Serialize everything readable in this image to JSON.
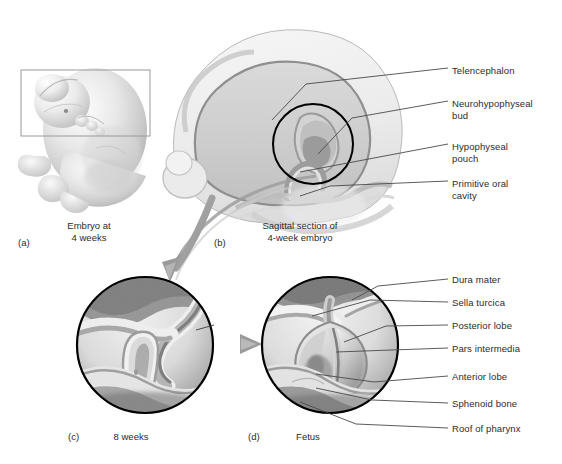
{
  "figure": {
    "background_color": "#ffffff",
    "ink_color": "#2b2b2b",
    "outline_color": "#000000",
    "arrow_color": "#9a9a9a",
    "tissue_light": "#ededed",
    "tissue_mid": "#cfcfcf",
    "tissue_dark": "#9d9d9d"
  },
  "panels": [
    {
      "id": "a",
      "letter": "(a)",
      "caption_line1": "Embryo at",
      "caption_line2": "4 weeks",
      "art": "embryo-whole-body-4-weeks",
      "has_selection_box": true
    },
    {
      "id": "b",
      "letter": "(b)",
      "caption_line1": "Sagittal section of",
      "caption_line2": "4-week embryo",
      "art": "sagittal-section-head-4-week-embryo",
      "has_magnifier_circle": true
    },
    {
      "id": "c",
      "letter": "(c)",
      "caption_line1": "8 weeks",
      "caption_line2": "",
      "art": "pituitary-development-8-weeks",
      "has_magnifier_circle": true
    },
    {
      "id": "d",
      "letter": "(d)",
      "caption_line1": "Fetus",
      "caption_line2": "",
      "art": "pituitary-fetus",
      "has_magnifier_circle": true
    }
  ],
  "labels_panel_b": [
    {
      "text": "Telencephalon",
      "x": 452,
      "y": 71
    },
    {
      "text": "Neurohypophyseal",
      "x": 452,
      "y": 104
    },
    {
      "text": "bud",
      "x": 452,
      "y": 116
    },
    {
      "text": "Hypophyseal",
      "x": 452,
      "y": 147
    },
    {
      "text": "pouch",
      "x": 452,
      "y": 159
    },
    {
      "text": "Primitive oral",
      "x": 452,
      "y": 184
    },
    {
      "text": "cavity",
      "x": 452,
      "y": 196
    }
  ],
  "labels_panel_d": [
    {
      "text": "Dura mater",
      "x": 452,
      "y": 282
    },
    {
      "text": "Sella turcica",
      "x": 452,
      "y": 305
    },
    {
      "text": "Posterior lobe",
      "x": 452,
      "y": 328
    },
    {
      "text": "Pars intermedia",
      "x": 452,
      "y": 351
    },
    {
      "text": "Anterior lobe",
      "x": 452,
      "y": 379
    },
    {
      "text": "Sphenoid bone",
      "x": 452,
      "y": 406
    },
    {
      "text": "Roof of pharynx",
      "x": 452,
      "y": 431
    }
  ],
  "captions": [
    {
      "letter": "(a)",
      "letter_x": 18,
      "letter_y": 243,
      "line1": "Embryo at",
      "line2": "4 weeks",
      "text_x": 55,
      "text_y": 225
    },
    {
      "letter": "(b)",
      "letter_x": 214,
      "letter_y": 243,
      "line1": "Sagittal section of",
      "line2": "4-week embryo",
      "text_x": 248,
      "text_y": 225
    },
    {
      "letter": "(c)",
      "letter_x": 68,
      "letter_y": 437,
      "line1": "8 weeks",
      "line2": "",
      "text_x": 112,
      "text_y": 437
    },
    {
      "letter": "(d)",
      "letter_x": 248,
      "letter_y": 437,
      "line1": "Fetus",
      "line2": "",
      "text_x": 295,
      "text_y": 437
    }
  ]
}
